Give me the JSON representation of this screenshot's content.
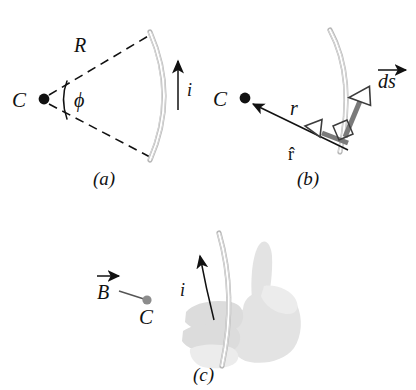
{
  "figure": {
    "background_color": "#ffffff",
    "wire_color": "#b9b9b9",
    "ink_color": "#111111",
    "vector_gray": "#7a7a7a",
    "hand_color": "#e3e3e3"
  },
  "panels": [
    {
      "id": "a",
      "caption": "(a)",
      "labels": {
        "center_point": "C",
        "radius": "R",
        "angle": "ϕ",
        "current": "i"
      },
      "description": "Circular arc of wire of radius R subtending angle phi at center C, carrying current i upward along the arc."
    },
    {
      "id": "b",
      "caption": "(b)",
      "labels": {
        "center_point": "C",
        "distance": "r",
        "unit_vector": "r̂",
        "element": "ds",
        "element_has_vector_arrow": true,
        "right_angle_marked": true
      },
      "description": "Differential current element ds on the wire, with unit vector r-hat pointing from the element toward C; ds and r-hat are perpendicular."
    },
    {
      "id": "c",
      "caption": "(c)",
      "labels": {
        "field": "B",
        "field_has_vector_arrow": true,
        "center_point": "C",
        "current": "i"
      },
      "description": "Right-hand rule: fingers curl in the direction of current i around the wire, thumb gives direction of B at point C."
    }
  ]
}
